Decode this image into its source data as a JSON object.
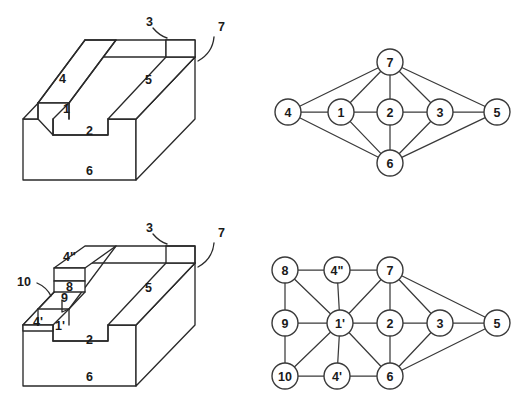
{
  "figure": {
    "caption": "",
    "panels": [
      {
        "id": "panel-top-left",
        "kind": "3d-block",
        "label": "ridge waveguide cross-section solid"
      },
      {
        "id": "panel-top-right",
        "kind": "graph",
        "label": "adjacency graph of ridge waveguide"
      },
      {
        "id": "panel-bottom-left",
        "kind": "3d-block",
        "label": "ridge waveguide with added layers solid"
      },
      {
        "id": "panel-bottom-right",
        "kind": "graph",
        "label": "adjacency graph of layered ridge waveguide"
      }
    ]
  },
  "top_left_solid": {
    "name": "ridge-waveguide-solid",
    "reference_labels": [
      {
        "text": "3",
        "x": 146,
        "y": 22
      },
      {
        "text": "7",
        "x": 218,
        "y": 27
      },
      {
        "text": "4",
        "x": 59,
        "y": 79
      },
      {
        "text": "5",
        "x": 145,
        "y": 80
      },
      {
        "text": "1",
        "x": 68,
        "y": 108
      },
      {
        "text": "2",
        "x": 89,
        "y": 131
      },
      {
        "text": "6",
        "x": 89,
        "y": 171
      }
    ]
  },
  "top_right_graph": {
    "name": "adjacency-graph-simple",
    "node_radius": 13,
    "nodes": [
      {
        "id": "n4",
        "label": "4",
        "x": 288,
        "y": 112
      },
      {
        "id": "n1",
        "label": "1",
        "x": 341,
        "y": 112
      },
      {
        "id": "n2",
        "label": "2",
        "x": 390,
        "y": 112
      },
      {
        "id": "n3",
        "label": "3",
        "x": 440,
        "y": 112
      },
      {
        "id": "n5",
        "label": "5",
        "x": 497,
        "y": 112
      },
      {
        "id": "n7",
        "label": "7",
        "x": 390,
        "y": 62
      },
      {
        "id": "n6",
        "label": "6",
        "x": 390,
        "y": 163
      }
    ],
    "edges": [
      [
        "n4",
        "n1"
      ],
      [
        "n1",
        "n2"
      ],
      [
        "n2",
        "n3"
      ],
      [
        "n3",
        "n5"
      ],
      [
        "n4",
        "n7"
      ],
      [
        "n1",
        "n7"
      ],
      [
        "n2",
        "n7"
      ],
      [
        "n3",
        "n7"
      ],
      [
        "n5",
        "n7"
      ],
      [
        "n4",
        "n6"
      ],
      [
        "n1",
        "n6"
      ],
      [
        "n2",
        "n6"
      ],
      [
        "n3",
        "n6"
      ],
      [
        "n5",
        "n6"
      ]
    ]
  },
  "bottom_left_solid": {
    "name": "layered-ridge-waveguide-solid",
    "reference_labels": [
      {
        "text": "4\"",
        "x": 84,
        "y": 251
      },
      {
        "text": "3",
        "x": 146,
        "y": 228
      },
      {
        "text": "7",
        "x": 218,
        "y": 233
      },
      {
        "text": "8",
        "x": 81,
        "y": 273
      },
      {
        "text": "10",
        "x": 22,
        "y": 285
      },
      {
        "text": "9",
        "x": 74,
        "y": 292
      },
      {
        "text": "5",
        "x": 145,
        "y": 288
      },
      {
        "text": "4'",
        "x": 48,
        "y": 320
      },
      {
        "text": "1'",
        "x": 70,
        "y": 323
      },
      {
        "text": "2",
        "x": 89,
        "y": 340
      },
      {
        "text": "6",
        "x": 89,
        "y": 377
      }
    ]
  },
  "bottom_right_graph": {
    "name": "adjacency-graph-layered",
    "node_radius": 13,
    "nodes": [
      {
        "id": "m8",
        "label": "8",
        "x": 285,
        "y": 270
      },
      {
        "id": "m4b",
        "label": "4\"",
        "x": 337,
        "y": 270
      },
      {
        "id": "m7",
        "label": "7",
        "x": 390,
        "y": 270
      },
      {
        "id": "m9",
        "label": "9",
        "x": 285,
        "y": 323
      },
      {
        "id": "m1p",
        "label": "1'",
        "x": 340,
        "y": 323
      },
      {
        "id": "m2",
        "label": "2",
        "x": 390,
        "y": 323
      },
      {
        "id": "m3",
        "label": "3",
        "x": 440,
        "y": 323
      },
      {
        "id": "m5",
        "label": "5",
        "x": 497,
        "y": 323
      },
      {
        "id": "m10",
        "label": "10",
        "x": 285,
        "y": 376
      },
      {
        "id": "m4a",
        "label": "4'",
        "x": 337,
        "y": 376
      },
      {
        "id": "m6",
        "label": "6",
        "x": 390,
        "y": 376
      }
    ],
    "edges": [
      [
        "m8",
        "m4b"
      ],
      [
        "m4b",
        "m7"
      ],
      [
        "m8",
        "m9"
      ],
      [
        "m9",
        "m10"
      ],
      [
        "m10",
        "m4a"
      ],
      [
        "m4a",
        "m6"
      ],
      [
        "m8",
        "m1p"
      ],
      [
        "m4b",
        "m1p"
      ],
      [
        "m9",
        "m1p"
      ],
      [
        "m10",
        "m1p"
      ],
      [
        "m4a",
        "m1p"
      ],
      [
        "m1p",
        "m7"
      ],
      [
        "m1p",
        "m2"
      ],
      [
        "m1p",
        "m6"
      ],
      [
        "m7",
        "m2"
      ],
      [
        "m2",
        "m6"
      ],
      [
        "m7",
        "m3"
      ],
      [
        "m3",
        "m6"
      ],
      [
        "m2",
        "m3"
      ],
      [
        "m3",
        "m5"
      ],
      [
        "m7",
        "m5"
      ],
      [
        "m5",
        "m6"
      ]
    ]
  }
}
